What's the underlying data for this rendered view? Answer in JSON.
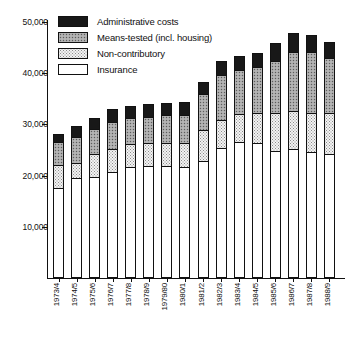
{
  "chart_data": {
    "type": "bar",
    "subtype": "stacked-bar",
    "title": "",
    "xlabel": "",
    "ylabel": "",
    "ylim": [
      0,
      50000
    ],
    "ytick_values": [
      10000,
      20000,
      30000,
      40000,
      50000
    ],
    "ytick_labels": [
      "10,000",
      "20,000",
      "30,000",
      "40,000",
      "50,000"
    ],
    "grid": false,
    "legend_position": "top-left",
    "categories": [
      "1973/4",
      "1974/5",
      "1975/6",
      "1976/7",
      "1977/8",
      "1978/9",
      "1979/80",
      "1980/1",
      "1981/2",
      "1982/3",
      "1983/4",
      "1984/5",
      "1985/6",
      "1986/7",
      "1987/8",
      "1988/9"
    ],
    "series": [
      {
        "name": "Insurance",
        "pattern": "solid-white",
        "color": "#ffffff",
        "values": [
          17400,
          19300,
          19600,
          20600,
          21500,
          21600,
          21600,
          21500,
          22700,
          25200,
          26300,
          26200,
          24700,
          25000,
          24400,
          24100
        ]
      },
      {
        "name": "Non-contributory",
        "pattern": "fine-dots",
        "color": "#f2f2f2",
        "values": [
          4500,
          3000,
          4400,
          4500,
          4500,
          4500,
          4600,
          4700,
          6100,
          5400,
          5600,
          5900,
          7400,
          7400,
          7600,
          7900
        ]
      },
      {
        "name": "Means-tested (incl. housing)",
        "pattern": "coarse-dots",
        "color": "#a8a8a8",
        "values": [
          4500,
          5100,
          5000,
          5200,
          5100,
          5200,
          5400,
          5500,
          7000,
          8900,
          8600,
          9000,
          10000,
          11600,
          11900,
          10700
        ]
      },
      {
        "name": "Administrative costs",
        "pattern": "solid-black",
        "color": "#181818",
        "values": [
          1600,
          2000,
          2100,
          2500,
          2300,
          2400,
          2400,
          2400,
          2300,
          2600,
          2600,
          2600,
          3600,
          3600,
          3400,
          3200
        ]
      }
    ],
    "totals": [
      28000,
      29400,
      31100,
      32800,
      33400,
      33700,
      34000,
      34100,
      38100,
      42100,
      43100,
      43700,
      45700,
      47600,
      47300,
      45900
    ]
  },
  "legend": {
    "items": [
      {
        "label": "Administrative costs",
        "swatch": "admin-swatch"
      },
      {
        "label": "Means-tested (incl. housing)",
        "swatch": "meanstested-swatch"
      },
      {
        "label": "Non-contributory",
        "swatch": "noncontrib-swatch"
      },
      {
        "label": "Insurance",
        "swatch": "insurance-swatch"
      }
    ]
  }
}
